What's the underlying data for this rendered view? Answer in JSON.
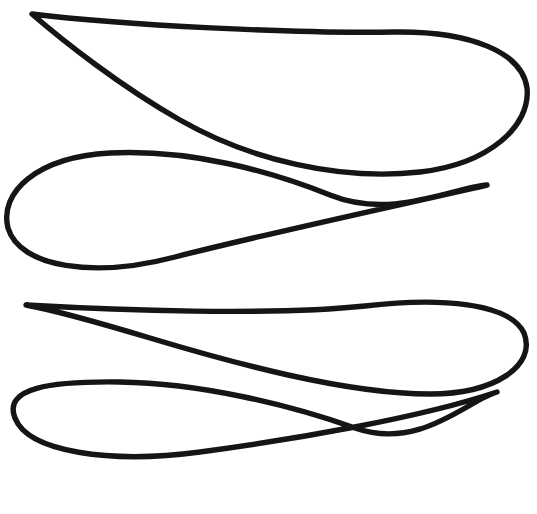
{
  "canvas": {
    "width": 537,
    "height": 514,
    "background_color": "#ffffff",
    "media": "line-drawing",
    "description": "Black ink line drawing of four overlapping leaf-like teardrop outlines stacked vertically"
  },
  "style": {
    "stroke_color": "#151515",
    "stroke_width": 5.4,
    "fill": "none",
    "linecap": "round",
    "linejoin": "round"
  },
  "shapes": [
    {
      "id": "leaf-1",
      "name": "leaf-shape-top",
      "orientation": "cusp-left",
      "cusp_point": [
        32,
        14
      ],
      "bulb_extent_x": 527,
      "bounds": [
        30,
        10,
        529,
        175
      ],
      "path": "M 32 14 C 120 25 300 34 395 32 C 470 31 522 52 527 88 C 531 126 489 164 420 172 C 340 181 250 160 180 120 C 120 86 62 40 32 14 Z"
    },
    {
      "id": "leaf-2",
      "name": "leaf-shape-second",
      "orientation": "cusp-right",
      "cusp_point": [
        487,
        185
      ],
      "bulb_extent_x": 6,
      "bounds": [
        4,
        150,
        489,
        275
      ],
      "path": "M 487 185 C 400 205 260 235 175 257 C 95 278 20 268 8 228 C -1 193 36 157 110 153 C 190 149 270 171 330 195 C 392 220 452 188 487 185 Z"
    },
    {
      "id": "leaf-3",
      "name": "leaf-shape-third",
      "orientation": "cusp-left",
      "cusp_point": [
        26,
        305
      ],
      "bulb_extent_x": 528,
      "bounds": [
        24,
        292,
        530,
        400
      ],
      "path": "M 26 305 C 115 310 270 316 365 306 C 440 297 510 303 524 333 C 537 366 494 394 430 394 C 345 394 230 362 150 338 C 90 320 48 309 26 305 Z"
    },
    {
      "id": "leaf-4",
      "name": "leaf-shape-bottom",
      "orientation": "cusp-right",
      "cusp_point": [
        497,
        392
      ],
      "bulb_extent_x": 13,
      "bounds": [
        11,
        380,
        499,
        500
      ],
      "path": "M 497 392 C 420 418 290 440 200 452 C 110 464 28 452 15 418 C 3 388 50 381 120 382 C 200 383 290 405 355 428 C 420 451 468 400 497 392 Z"
    }
  ]
}
